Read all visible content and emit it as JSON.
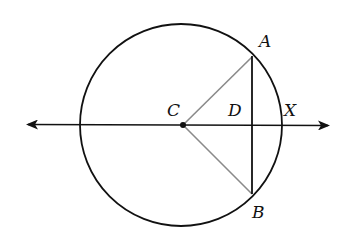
{
  "diagram": {
    "type": "circle-geometry",
    "labels": {
      "center": "C",
      "point_a": "A",
      "point_b": "B",
      "point_d": "D",
      "point_x": "X"
    },
    "colors": {
      "stroke": "#111111",
      "radius_segment": "#8a8a8a"
    },
    "elements": [
      "circle centered at C",
      "line through C with arrows on both ends passing through D and X",
      "chord AB perpendicular to line at D",
      "segments CA and CB (gray)"
    ]
  }
}
